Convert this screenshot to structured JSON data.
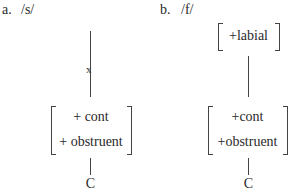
{
  "top_cutoff": {
    "left": "example (a)",
    "right": "example (b)"
  },
  "panel_a": {
    "label": "a.",
    "phoneme": "/s/",
    "delink_mark": "x",
    "features": [
      "+ cont",
      "+ obstruent"
    ],
    "node": "C"
  },
  "panel_b": {
    "label": "b.",
    "phoneme": "/f/",
    "top_feature": "+labial",
    "features": [
      "+cont",
      "+obstruent"
    ],
    "node": "C"
  }
}
